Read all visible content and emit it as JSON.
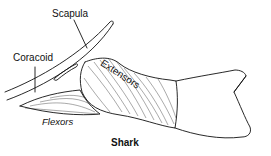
{
  "figure": {
    "labels": {
      "scapula": "Scapula",
      "coracoid": "Coracoid",
      "extensors": "Extensors",
      "flexors": "Flexors",
      "title": "Shark"
    },
    "colors": {
      "ink": "#111111",
      "background": "#ffffff"
    }
  }
}
